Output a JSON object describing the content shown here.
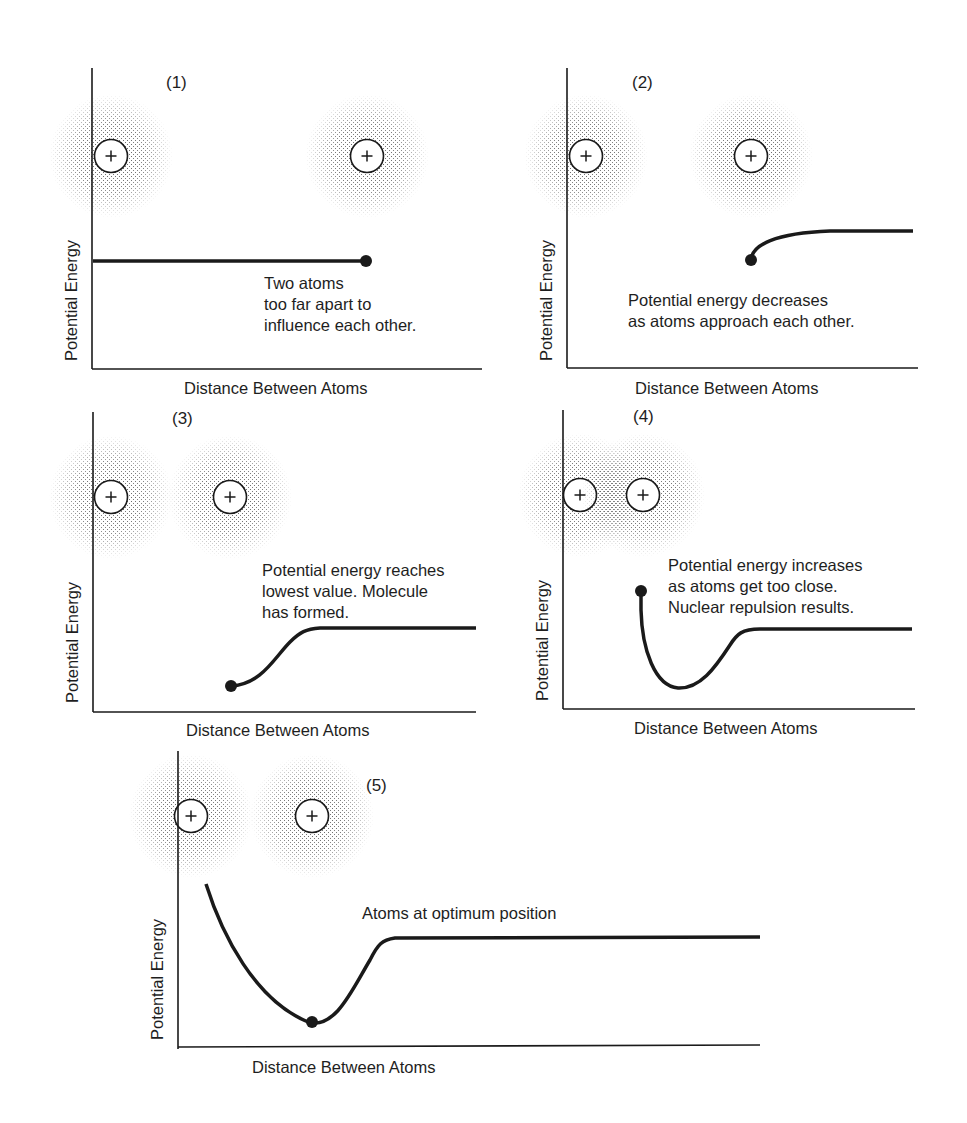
{
  "figure": {
    "panels": [
      {
        "id": "1",
        "label": "(1)",
        "xlabel": "Distance Between Atoms",
        "ylabel": "Potential Energy",
        "annotation": "Two atoms\ntoo far apart to\ninfluence each other.",
        "state": "atoms far apart, flat potential energy"
      },
      {
        "id": "2",
        "label": "(2)",
        "xlabel": "Distance Between Atoms",
        "ylabel": "Potential Energy",
        "annotation": "Potential energy decreases\nas atoms approach each other.",
        "state": "atoms approaching, energy begins to decrease"
      },
      {
        "id": "3",
        "label": "(3)",
        "xlabel": "Distance Between Atoms",
        "ylabel": "Potential Energy",
        "annotation": "Potential energy reaches\nlowest value. Molecule\nhas formed.",
        "state": "energy minimum, molecule formed"
      },
      {
        "id": "4",
        "label": "(4)",
        "xlabel": "Distance Between Atoms",
        "ylabel": "Potential Energy",
        "annotation": "Potential energy increases\nas atoms get too close.\nNuclear repulsion results.",
        "state": "atoms too close, nuclear repulsion"
      },
      {
        "id": "5",
        "label": "(5)",
        "xlabel": "Distance Between Atoms",
        "ylabel": "Potential Energy",
        "annotation": "Atoms at optimum position",
        "state": "atoms at bond length, energy minimum"
      }
    ],
    "nucleus_symbol": "+",
    "colors": {
      "ink": "#1a1a1a",
      "electron_cloud": "#555555",
      "background": "#ffffff"
    }
  }
}
